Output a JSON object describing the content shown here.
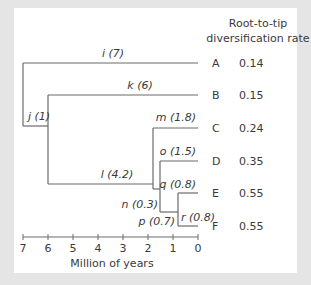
{
  "header": {
    "line1": "Root-to-tip",
    "line2": "diversification rate"
  },
  "axis": {
    "label": "Million of years",
    "ticks": [
      "7",
      "6",
      "5",
      "4",
      "3",
      "2",
      "1",
      "0"
    ]
  },
  "branches": {
    "i": "i (7)",
    "j": "j (1)",
    "k": "k (6)",
    "l": "l  (4.2)",
    "m": "m (1.8)",
    "n": "n (0.3)",
    "o": "o (1.5)",
    "p": "p (0.7)",
    "q": "q (0.8)",
    "r": "r (0.8)"
  },
  "tips": [
    {
      "name": "A",
      "rate": "0.14"
    },
    {
      "name": "B",
      "rate": "0.15"
    },
    {
      "name": "C",
      "rate": "0.24"
    },
    {
      "name": "D",
      "rate": "0.35"
    },
    {
      "name": "E",
      "rate": "0.55"
    },
    {
      "name": "F",
      "rate": "0.55"
    }
  ],
  "colors": {
    "frame": "#e5e5e5",
    "line": "#6b6b6b",
    "text": "#3a3a3a"
  }
}
